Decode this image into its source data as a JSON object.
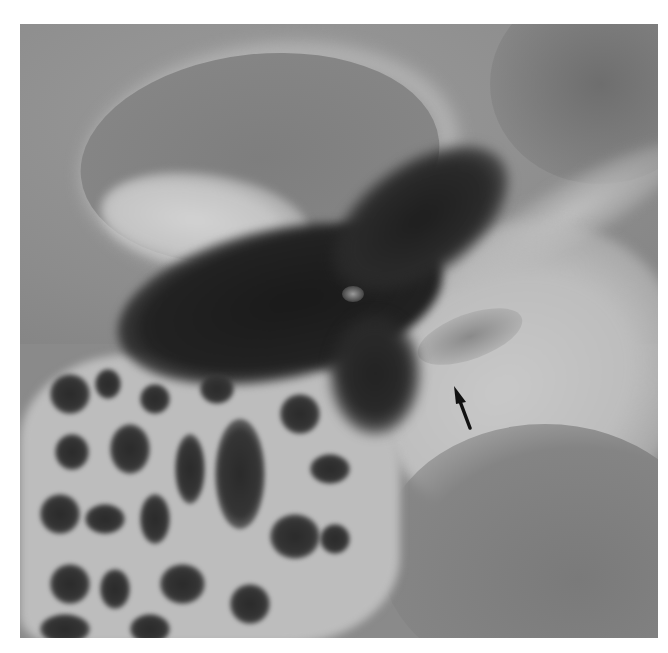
{
  "image": {
    "description": "Grayscale axial CT of temporal bone with annotation arrow",
    "palette": {
      "background": "#ffffff",
      "soft_tissue": "#8a8a8a",
      "bone": "#c4c4c4",
      "air": "#1e1e1e"
    }
  },
  "annotations": [
    {
      "type": "arrow",
      "direction": "up-left",
      "color": "#111111",
      "tip_x": 455,
      "tip_y": 388
    }
  ]
}
